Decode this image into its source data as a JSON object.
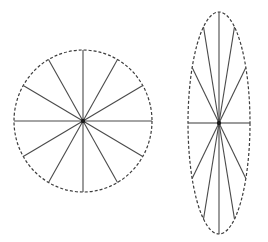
{
  "figure": {
    "canvas": {
      "width": 268,
      "height": 242,
      "background": "#ffffff"
    },
    "style": {
      "outline_color": "#3c3c3c",
      "outline_width": 1.2,
      "outline_dash": "3 2",
      "spoke_color": "#4a4a4a",
      "spoke_width": 1.1,
      "center_dot_color": "#1a1a1a",
      "center_dot_radius": 2.2
    },
    "shapes": [
      {
        "name": "circle",
        "label": "circle",
        "outline_type": "dashed-ellipse",
        "center": {
          "x": 83,
          "y": 121
        },
        "radius": {
          "rx": 69,
          "ry": 71
        },
        "rotation_deg": 0,
        "spoke_count": 12,
        "spoke_angles_deg": [
          0,
          30,
          60,
          90,
          120,
          150,
          180,
          210,
          240,
          270,
          300,
          330
        ],
        "has_center_dot": true
      },
      {
        "name": "ellipse",
        "label": "ellipse",
        "outline_type": "dashed-ellipse",
        "center": {
          "x": 219,
          "y": 123
        },
        "radius": {
          "rx": 31,
          "ry": 111
        },
        "rotation_deg": 0,
        "spoke_count": 12,
        "spoke_angles_deg": [
          0,
          30,
          60,
          90,
          120,
          150,
          180,
          210,
          240,
          270,
          300,
          330
        ],
        "has_center_dot": true
      }
    ]
  }
}
